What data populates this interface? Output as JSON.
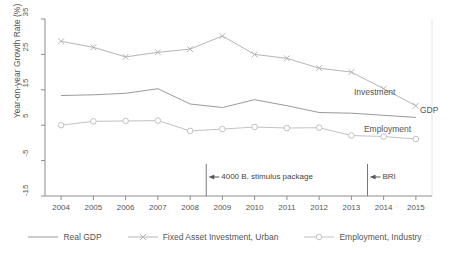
{
  "chart_data": {
    "type": "line",
    "title": "",
    "xlabel": "",
    "ylabel": "Year-on-year Growth Rate (%)",
    "x": [
      2004,
      2005,
      2006,
      2007,
      2008,
      2009,
      2010,
      2011,
      2012,
      2013,
      2014,
      2015
    ],
    "categories": [
      "2004",
      "2005",
      "2006",
      "2007",
      "2008",
      "2009",
      "2010",
      "2011",
      "2012",
      "2013",
      "2014",
      "2015"
    ],
    "ylim": [
      -15,
      35
    ],
    "yticks": [
      35,
      25,
      15,
      5,
      -5,
      -15
    ],
    "xlim": [
      2003.5,
      2015.5
    ],
    "grid": false,
    "legend_position": "bottom",
    "series": [
      {
        "name": "Real GDP",
        "short_label": "GDP",
        "marker": "none",
        "color": "#9a9a9a",
        "values": [
          13.4,
          13.6,
          14.0,
          15.3,
          11.0,
          10.0,
          12.2,
          10.5,
          8.6,
          8.4,
          7.8,
          7.2
        ]
      },
      {
        "name": "Fixed Asset Investment, Urban",
        "short_label": "Investment",
        "marker": "x",
        "color": "#b5b5b5",
        "values": [
          28.7,
          27.0,
          24.3,
          25.6,
          26.5,
          30.2,
          25.0,
          23.9,
          21.1,
          20.0,
          15.3,
          10.5
        ]
      },
      {
        "name": "Employment, Industry",
        "short_label": "Employment",
        "marker": "circle",
        "color": "#c2c2c2",
        "values": [
          5.0,
          6.1,
          6.2,
          6.3,
          3.4,
          3.9,
          4.5,
          4.2,
          4.3,
          2.1,
          1.8,
          1.1
        ]
      }
    ],
    "annotations": [
      {
        "label": "4000 B. stimulus package",
        "at_x": 2008.5,
        "arrow": "left"
      },
      {
        "label": "BRI",
        "at_x": 2013.5,
        "arrow": "left"
      }
    ]
  },
  "legend": {
    "items": [
      {
        "label": "Real GDP",
        "marker": "line"
      },
      {
        "label": "Fixed Asset Investment, Urban",
        "marker": "x"
      },
      {
        "label": "Employment, Industry",
        "marker": "circle"
      }
    ]
  },
  "colors": {
    "gdp": "#9a9a9a",
    "investment": "#b5b5b5",
    "employment": "#c2c2c2",
    "axis": "#8c8c8c",
    "text": "#555555"
  }
}
